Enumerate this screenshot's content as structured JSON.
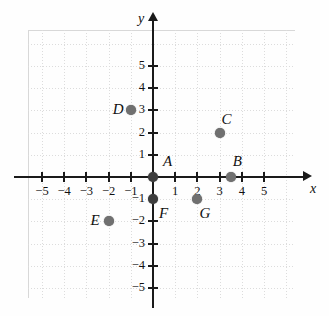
{
  "chart_data": {
    "type": "scatter",
    "title": "",
    "xlabel": "x",
    "ylabel": "y",
    "xlim": [
      -6,
      6
    ],
    "ylim": [
      -6,
      6
    ],
    "grid": true,
    "legend": "none",
    "xticks": [
      -5,
      -4,
      -3,
      -2,
      -1,
      1,
      2,
      3,
      4,
      5
    ],
    "yticks": [
      5,
      4,
      3,
      2,
      1,
      -1,
      -2,
      -3,
      -4,
      -5
    ],
    "xtick_labels": [
      "−5",
      "−4",
      "−3",
      "−2",
      "−1",
      "1",
      "2",
      "3",
      "4",
      "5"
    ],
    "ytick_labels": [
      "5",
      "4",
      "3",
      "2",
      "1",
      "−1",
      "−2",
      "−3",
      "−4",
      "−5"
    ],
    "points": [
      {
        "label": "A",
        "x": 0,
        "y": 0,
        "label_dx": 10,
        "label_dy": -24
      },
      {
        "label": "B",
        "x": 3.5,
        "y": 0,
        "label_dx": 2,
        "label_dy": -24
      },
      {
        "label": "C",
        "x": 3,
        "y": 2,
        "label_dx": 2,
        "label_dy": -22
      },
      {
        "label": "D",
        "x": -1,
        "y": 3,
        "label_dx": -18,
        "label_dy": -9
      },
      {
        "label": "E",
        "x": -2,
        "y": -2,
        "label_dx": -18,
        "label_dy": -9
      },
      {
        "label": "F",
        "x": 0,
        "y": -1,
        "label_dx": 6,
        "label_dy": 6
      },
      {
        "label": "G",
        "x": 2,
        "y": -1,
        "label_dx": 2,
        "label_dy": 6
      }
    ],
    "point_color": "#707070",
    "axis_color": "#1a1a1a",
    "grid_color": "#d8d8d8"
  }
}
